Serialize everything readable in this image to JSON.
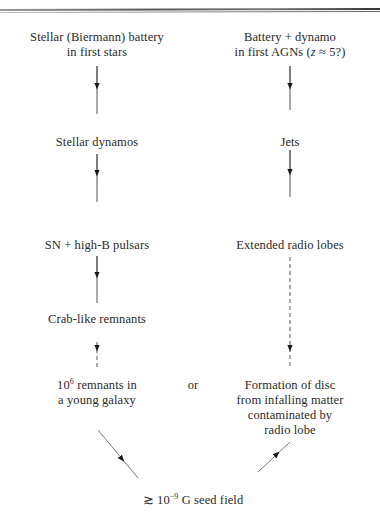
{
  "diagram": {
    "type": "flowchart",
    "layout": "two converging columns",
    "left_column": {
      "nodes": [
        {
          "id": "stellar-battery",
          "lines": [
            "Stellar (Biermann) battery",
            "in first stars"
          ]
        },
        {
          "id": "stellar-dynamos",
          "lines": [
            "Stellar dynamos"
          ]
        },
        {
          "id": "sn-pulsars",
          "lines": [
            "SN + high-B pulsars"
          ]
        },
        {
          "id": "crab-remnants",
          "lines": [
            "Crab-like remnants"
          ]
        },
        {
          "id": "young-galaxy-remnants",
          "lines_prefix": "10",
          "superscript": "6",
          "line1_suffix": " remnants in",
          "line2": "a young galaxy"
        }
      ]
    },
    "right_column": {
      "nodes": [
        {
          "id": "agn-battery",
          "line1": "Battery + dynamo",
          "line2_prefix": "in first AGNs (",
          "line2_var": "z",
          "line2_suffix": " ≈ 5?)"
        },
        {
          "id": "jets",
          "lines": [
            "Jets"
          ]
        },
        {
          "id": "radio-lobes",
          "lines": [
            "Extended radio lobes"
          ]
        },
        {
          "id": "disc-formation",
          "lines": [
            "Formation of disc",
            "from infalling matter",
            "contaminated by",
            "radio lobe"
          ]
        }
      ]
    },
    "connector": "or",
    "sink": {
      "prefix": "≳ 10",
      "superscript": "−9",
      "suffix": " G seed field"
    },
    "edges": [
      {
        "from": "stellar-battery",
        "to": "stellar-dynamos",
        "style": "solid"
      },
      {
        "from": "stellar-dynamos",
        "to": "sn-pulsars",
        "style": "solid"
      },
      {
        "from": "sn-pulsars",
        "to": "crab-remnants",
        "style": "solid"
      },
      {
        "from": "crab-remnants",
        "to": "young-galaxy-remnants",
        "style": "dashed"
      },
      {
        "from": "agn-battery",
        "to": "jets",
        "style": "solid"
      },
      {
        "from": "jets",
        "to": "radio-lobes",
        "style": "solid"
      },
      {
        "from": "radio-lobes",
        "to": "disc-formation",
        "style": "dashed"
      },
      {
        "from": "young-galaxy-remnants",
        "to": "sink",
        "style": "solid"
      },
      {
        "from": "disc-formation",
        "to": "sink",
        "style": "solid"
      }
    ],
    "colors": {
      "line": "#555555",
      "arrowhead": "#1a1a1a",
      "text": "#2a2a2a"
    }
  }
}
